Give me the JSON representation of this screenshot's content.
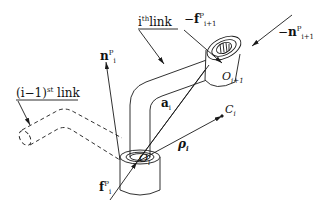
{
  "diagram": {
    "labels": {
      "prev_link": {
        "base": "(i−1)",
        "sup": "st",
        "tail": " link"
      },
      "this_link": {
        "base": "i",
        "sup": "th",
        "tail": "link"
      },
      "n_i": {
        "base": "n",
        "sub": "i",
        "sup": "P"
      },
      "neg_f_next": {
        "sign": "−",
        "base": "f",
        "sub": "i+1",
        "sup": "P"
      },
      "neg_n_next": {
        "sign": "−",
        "base": "n",
        "sub": "i+1",
        "sup": "P"
      },
      "O_next": {
        "base": "O",
        "sub": "i+1"
      },
      "a_i": {
        "base": "a",
        "sub": "i"
      },
      "C_i": {
        "base": "C",
        "sub": "i"
      },
      "rho_i": {
        "base": "ρ",
        "sub": "i"
      },
      "O_i": {
        "base": "O",
        "sub": "i"
      },
      "f_i": {
        "base": "f",
        "sub": "i",
        "sup": "P"
      }
    },
    "colors": {
      "stroke": "#1a1a1a",
      "background": "#ffffff"
    }
  }
}
